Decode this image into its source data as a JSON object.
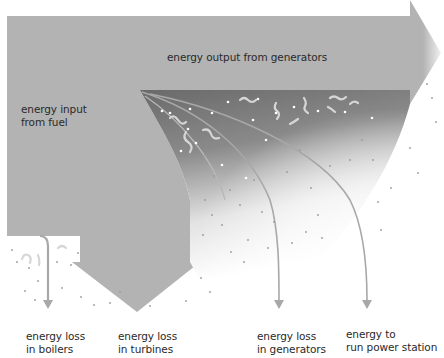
{
  "diagram": {
    "type": "sankey-energy-flow",
    "colors": {
      "flow_fill": "#b3b3b3",
      "wedge_dark": "#6a6a6a",
      "wedge_light": "#ffffff",
      "arrow_line": "#a8a8a8",
      "text": "#2a2a2a",
      "background": "#ffffff"
    },
    "labels": {
      "output": "energy output from generators",
      "input_line1": "energy input",
      "input_line2": "from fuel",
      "boilers_line1": "energy loss",
      "boilers_line2": "in boilers",
      "turbines_line1": "energy loss",
      "turbines_line2": "in turbines",
      "generators_line1": "energy loss",
      "generators_line2": "in generators",
      "station_line1": "energy to",
      "station_line2": "run power station"
    },
    "flows": [
      {
        "name": "energy input from fuel",
        "direction": "in"
      },
      {
        "name": "energy output from generators",
        "direction": "right"
      },
      {
        "name": "energy loss in boilers",
        "direction": "down"
      },
      {
        "name": "energy loss in turbines",
        "direction": "down"
      },
      {
        "name": "energy loss in generators",
        "direction": "down"
      },
      {
        "name": "energy to run power station",
        "direction": "down"
      }
    ]
  }
}
